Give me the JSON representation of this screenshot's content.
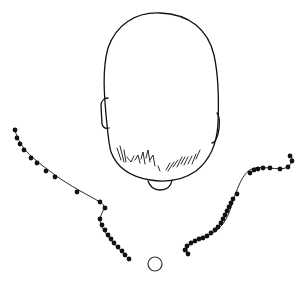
{
  "figure": {
    "colors": {
      "background": "#ffffff",
      "stroke": "#111111",
      "bead": "#111111"
    },
    "elements": {
      "head": "head-outline",
      "left_ear": "left-ear",
      "right_ear": "right-ear",
      "hairline": "nape-hair-strokes",
      "nose_tip": "chin-protrusion",
      "left_chain": "left-bead-chain",
      "right_chain": "right-bead-chain",
      "circle": "open-circle-marker"
    }
  }
}
